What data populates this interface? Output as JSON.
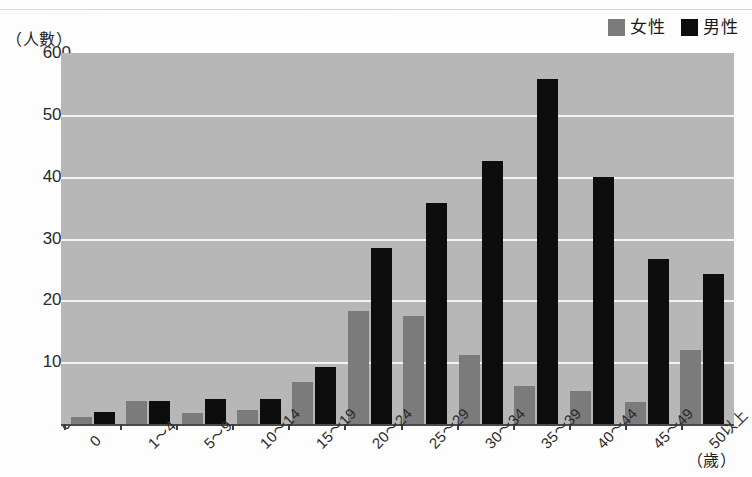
{
  "legend": {
    "entries": [
      {
        "label": "女性",
        "color": "#7b7b7b",
        "key": "female"
      },
      {
        "label": "男性",
        "color": "#0d0d0d",
        "key": "male"
      }
    ]
  },
  "axes": {
    "y_unit": "（人數）",
    "x_unit": "（歲）"
  },
  "chart_data": {
    "type": "bar",
    "title": "",
    "subtitle": "",
    "xlabel": "（歲）",
    "ylabel": "（人數）",
    "ylim": [
      0,
      600
    ],
    "yticks": [
      0,
      100,
      200,
      300,
      400,
      500,
      600
    ],
    "ytick_labels": [
      "0",
      "100",
      "200",
      "300",
      "400",
      "500",
      "600"
    ],
    "grid": true,
    "legend_position": "top-right",
    "plot_background": "#b7b7b7",
    "gridline_color": "#f4f4f4",
    "categories": [
      "0",
      "1～4",
      "5～9",
      "10～14",
      "15～19",
      "20～24",
      "25～29",
      "30～34",
      "35～39",
      "40～44",
      "45～49",
      "50以上"
    ],
    "series": [
      {
        "name": "女性",
        "color": "#7b7b7b",
        "values": [
          12,
          38,
          18,
          22,
          68,
          182,
          175,
          112,
          62,
          53,
          35,
          120
        ]
      },
      {
        "name": "男性",
        "color": "#0d0d0d",
        "values": [
          20,
          38,
          40,
          41,
          92,
          285,
          357,
          425,
          558,
          400,
          267,
          242
        ]
      }
    ]
  }
}
